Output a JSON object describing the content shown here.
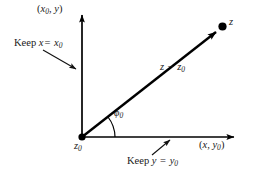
{
  "figure": {
    "background_color": "#ffffff",
    "stroke_color": "#000000",
    "labels": {
      "vertical_axis": "(x₀, y)",
      "horizontal_axis": "(x, y₀)",
      "keep_x": "Keep x = x₀",
      "keep_y": "Keep y = y₀",
      "vector": "z − z₀",
      "point_z": "z",
      "point_z0": "z₀",
      "angle": "ϕ₀"
    },
    "label_parts": {
      "vertical_axis": {
        "open": "(",
        "var1": "x",
        "sub1": "0",
        "comma": ", ",
        "var2": "y",
        "close": ")"
      },
      "horizontal_axis": {
        "open": "(",
        "var1": "x",
        "comma": ", ",
        "var2": "y",
        "sub2": "0",
        "close": ")"
      },
      "keep_x": {
        "word": "Keep",
        "lhs": "x",
        "op": "=",
        "rhs": "x",
        "rhs_sub": "0"
      },
      "keep_y": {
        "word": "Keep",
        "lhs": "y",
        "op": "=",
        "rhs": "y",
        "rhs_sub": "0"
      },
      "vector": {
        "lhs": "z",
        "op": "−",
        "rhs": "z",
        "rhs_sub": "0"
      },
      "point_z": {
        "var": "z"
      },
      "point_z0": {
        "var": "z",
        "sub": "0"
      },
      "angle": {
        "var": "ϕ",
        "sub": "0"
      }
    }
  },
  "geometry": {
    "origin": {
      "x": 82,
      "y": 137
    },
    "point_z": {
      "x": 222,
      "y": 27
    },
    "y_axis_tip": {
      "x": 82,
      "y": 10
    },
    "x_axis_tip": {
      "x": 239,
      "y": 137
    },
    "angle_arc_radius": 30,
    "angle_degrees": 38
  }
}
